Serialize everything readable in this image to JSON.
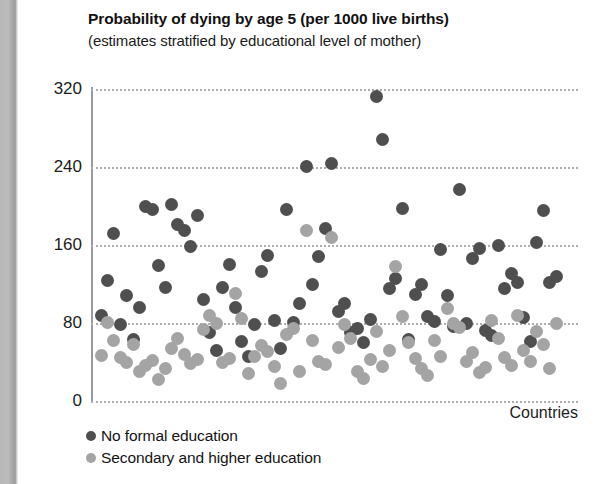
{
  "page": {
    "gutter_color": "#b8b8b8",
    "background": "#ffffff"
  },
  "chart_data": {
    "type": "scatter",
    "title": "Probability of dying by age 5 (per 1000 live births)",
    "subtitle": "(estimates stratified by educational level of mother)",
    "xlabel": "Countries",
    "ylabel": "",
    "ylim": [
      0,
      320
    ],
    "yticks": [
      0,
      80,
      160,
      240,
      320
    ],
    "ytick_labels": [
      "0",
      "80",
      "160",
      "240",
      "320"
    ],
    "grid": true,
    "grid_style": "dotted",
    "legend_position": "below-left",
    "colors": {
      "no_formal_education": "#4f4f4f",
      "secondary_and_higher_education": "#a4a4a4",
      "gridline": "#aeaeae",
      "axis": "#9a9a9a"
    },
    "series": [
      {
        "name": "No formal education",
        "color": "#4f4f4f",
        "points": [
          {
            "x": 1,
            "y": 88
          },
          {
            "x": 2,
            "y": 124
          },
          {
            "x": 3,
            "y": 172
          },
          {
            "x": 4,
            "y": 78
          },
          {
            "x": 5,
            "y": 108
          },
          {
            "x": 6,
            "y": 63
          },
          {
            "x": 7,
            "y": 96
          },
          {
            "x": 8,
            "y": 200
          },
          {
            "x": 9,
            "y": 196
          },
          {
            "x": 10,
            "y": 139
          },
          {
            "x": 11,
            "y": 116
          },
          {
            "x": 12,
            "y": 202
          },
          {
            "x": 13,
            "y": 181
          },
          {
            "x": 14,
            "y": 175
          },
          {
            "x": 15,
            "y": 158
          },
          {
            "x": 16,
            "y": 190
          },
          {
            "x": 17,
            "y": 104
          },
          {
            "x": 18,
            "y": 70
          },
          {
            "x": 19,
            "y": 52
          },
          {
            "x": 20,
            "y": 116
          },
          {
            "x": 21,
            "y": 140
          },
          {
            "x": 22,
            "y": 96
          },
          {
            "x": 23,
            "y": 61
          },
          {
            "x": 24,
            "y": 46
          },
          {
            "x": 25,
            "y": 78
          },
          {
            "x": 26,
            "y": 133
          },
          {
            "x": 27,
            "y": 149
          },
          {
            "x": 28,
            "y": 83
          },
          {
            "x": 29,
            "y": 54
          },
          {
            "x": 30,
            "y": 196
          },
          {
            "x": 31,
            "y": 81
          },
          {
            "x": 32,
            "y": 100
          },
          {
            "x": 33,
            "y": 241
          },
          {
            "x": 34,
            "y": 119
          },
          {
            "x": 35,
            "y": 148
          },
          {
            "x": 36,
            "y": 177
          },
          {
            "x": 37,
            "y": 244
          },
          {
            "x": 38,
            "y": 92
          },
          {
            "x": 39,
            "y": 100
          },
          {
            "x": 40,
            "y": 70
          },
          {
            "x": 41,
            "y": 74
          },
          {
            "x": 42,
            "y": 60
          },
          {
            "x": 43,
            "y": 84
          },
          {
            "x": 44,
            "y": 312
          },
          {
            "x": 45,
            "y": 268
          },
          {
            "x": 46,
            "y": 115
          },
          {
            "x": 47,
            "y": 126
          },
          {
            "x": 48,
            "y": 197
          },
          {
            "x": 49,
            "y": 63
          },
          {
            "x": 50,
            "y": 109
          },
          {
            "x": 51,
            "y": 120
          },
          {
            "x": 52,
            "y": 87
          },
          {
            "x": 53,
            "y": 82
          },
          {
            "x": 54,
            "y": 155
          },
          {
            "x": 55,
            "y": 108
          },
          {
            "x": 56,
            "y": 76
          },
          {
            "x": 57,
            "y": 217
          },
          {
            "x": 58,
            "y": 79
          },
          {
            "x": 59,
            "y": 146
          },
          {
            "x": 60,
            "y": 156
          },
          {
            "x": 61,
            "y": 72
          },
          {
            "x": 62,
            "y": 67
          },
          {
            "x": 63,
            "y": 160
          },
          {
            "x": 64,
            "y": 115
          },
          {
            "x": 65,
            "y": 131
          },
          {
            "x": 66,
            "y": 122
          },
          {
            "x": 67,
            "y": 86
          },
          {
            "x": 68,
            "y": 61
          },
          {
            "x": 69,
            "y": 163
          },
          {
            "x": 70,
            "y": 195
          },
          {
            "x": 71,
            "y": 122
          },
          {
            "x": 72,
            "y": 128
          }
        ]
      },
      {
        "name": "Secondary and higher education",
        "color": "#a4a4a4",
        "points": [
          {
            "x": 1,
            "y": 47
          },
          {
            "x": 2,
            "y": 81
          },
          {
            "x": 3,
            "y": 62
          },
          {
            "x": 4,
            "y": 45
          },
          {
            "x": 5,
            "y": 39
          },
          {
            "x": 6,
            "y": 58
          },
          {
            "x": 7,
            "y": 30
          },
          {
            "x": 8,
            "y": 36
          },
          {
            "x": 9,
            "y": 42
          },
          {
            "x": 10,
            "y": 22
          },
          {
            "x": 11,
            "y": 33
          },
          {
            "x": 12,
            "y": 54
          },
          {
            "x": 13,
            "y": 64
          },
          {
            "x": 14,
            "y": 48
          },
          {
            "x": 15,
            "y": 38
          },
          {
            "x": 16,
            "y": 43
          },
          {
            "x": 17,
            "y": 73
          },
          {
            "x": 18,
            "y": 88
          },
          {
            "x": 19,
            "y": 79
          },
          {
            "x": 20,
            "y": 40
          },
          {
            "x": 21,
            "y": 44
          },
          {
            "x": 22,
            "y": 110
          },
          {
            "x": 23,
            "y": 85
          },
          {
            "x": 24,
            "y": 28
          },
          {
            "x": 25,
            "y": 46
          },
          {
            "x": 26,
            "y": 57
          },
          {
            "x": 27,
            "y": 51
          },
          {
            "x": 28,
            "y": 35
          },
          {
            "x": 29,
            "y": 18
          },
          {
            "x": 30,
            "y": 68
          },
          {
            "x": 31,
            "y": 74
          },
          {
            "x": 32,
            "y": 30
          },
          {
            "x": 33,
            "y": 175
          },
          {
            "x": 34,
            "y": 62
          },
          {
            "x": 35,
            "y": 41
          },
          {
            "x": 36,
            "y": 37
          },
          {
            "x": 37,
            "y": 168
          },
          {
            "x": 38,
            "y": 55
          },
          {
            "x": 39,
            "y": 78
          },
          {
            "x": 40,
            "y": 64
          },
          {
            "x": 41,
            "y": 30
          },
          {
            "x": 42,
            "y": 23
          },
          {
            "x": 43,
            "y": 43
          },
          {
            "x": 44,
            "y": 71
          },
          {
            "x": 45,
            "y": 35
          },
          {
            "x": 46,
            "y": 52
          },
          {
            "x": 47,
            "y": 138
          },
          {
            "x": 48,
            "y": 87
          },
          {
            "x": 49,
            "y": 60
          },
          {
            "x": 50,
            "y": 44
          },
          {
            "x": 51,
            "y": 33
          },
          {
            "x": 52,
            "y": 26
          },
          {
            "x": 53,
            "y": 62
          },
          {
            "x": 54,
            "y": 46
          },
          {
            "x": 55,
            "y": 95
          },
          {
            "x": 56,
            "y": 79
          },
          {
            "x": 57,
            "y": 75
          },
          {
            "x": 58,
            "y": 41
          },
          {
            "x": 59,
            "y": 50
          },
          {
            "x": 60,
            "y": 29
          },
          {
            "x": 61,
            "y": 34
          },
          {
            "x": 62,
            "y": 83
          },
          {
            "x": 63,
            "y": 64
          },
          {
            "x": 64,
            "y": 45
          },
          {
            "x": 65,
            "y": 36
          },
          {
            "x": 66,
            "y": 88
          },
          {
            "x": 67,
            "y": 52
          },
          {
            "x": 68,
            "y": 41
          },
          {
            "x": 69,
            "y": 71
          },
          {
            "x": 70,
            "y": 58
          },
          {
            "x": 71,
            "y": 33
          },
          {
            "x": 72,
            "y": 80
          }
        ]
      }
    ]
  },
  "legend": {
    "items": [
      {
        "label": "No formal education",
        "color": "#4f4f4f"
      },
      {
        "label": "Secondary and higher education",
        "color": "#a4a4a4"
      }
    ]
  }
}
